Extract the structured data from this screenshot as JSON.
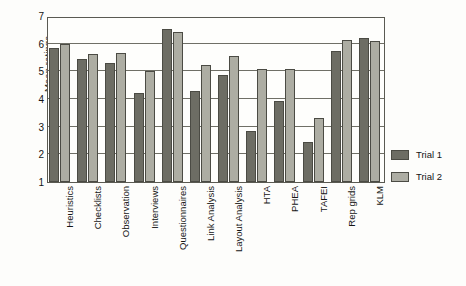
{
  "chart_data": {
    "type": "bar",
    "title": "",
    "xlabel": "",
    "ylabel": "Mean ratings",
    "ylim": [
      1,
      7
    ],
    "yticks": [
      7,
      6,
      5,
      4,
      3,
      2,
      1
    ],
    "grid": true,
    "legend_position": "right",
    "categories": [
      "Heuristics",
      "Checklists",
      "Observation",
      "Interviews",
      "Questionnaires",
      "Link Analysis",
      "Layout Analysis",
      "HTA",
      "PHEA",
      "TAFEI",
      "Rep grids",
      "KLM"
    ],
    "series": [
      {
        "name": "Trial 1",
        "color": "#6d6d64",
        "values": [
          5.85,
          5.45,
          5.3,
          4.22,
          6.52,
          4.3,
          4.85,
          2.83,
          3.92,
          2.45,
          5.73,
          6.2
        ]
      },
      {
        "name": "Trial 2",
        "color": "#adada3",
        "values": [
          6.0,
          5.62,
          5.67,
          5.0,
          6.43,
          5.23,
          5.57,
          5.08,
          5.08,
          3.3,
          6.12,
          6.1
        ]
      }
    ]
  },
  "legend": {
    "items": [
      {
        "label": "Trial 1"
      },
      {
        "label": "Trial 2"
      }
    ]
  }
}
